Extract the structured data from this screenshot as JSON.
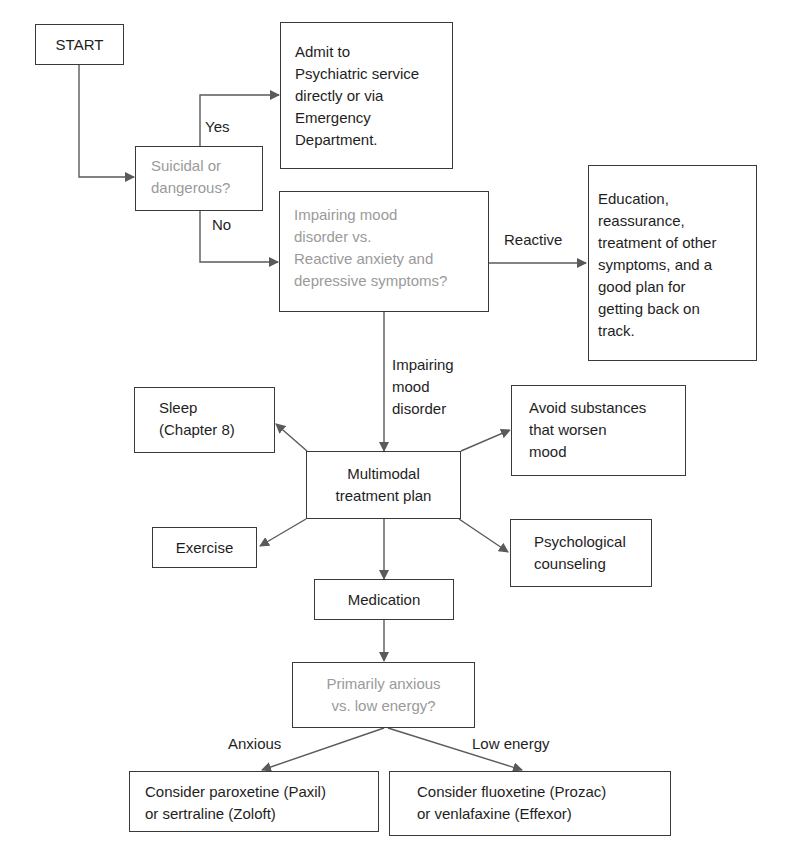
{
  "flowchart": {
    "start": {
      "label": "START"
    },
    "q_suicidal": {
      "lines": [
        "Suicidal or",
        "dangerous?"
      ]
    },
    "admit": {
      "lines": [
        "Admit to",
        "Psychiatric service",
        "directly or via",
        "Emergency",
        "Department."
      ]
    },
    "q_mood": {
      "lines": [
        "Impairing mood",
        "disorder vs.",
        "Reactive anxiety and",
        "depressive symptoms?"
      ]
    },
    "education": {
      "lines": [
        "Education,",
        "reassurance,",
        "treatment of other",
        "symptoms, and a",
        "good plan for",
        "getting back on",
        "track."
      ]
    },
    "sleep": {
      "lines": [
        "Sleep",
        "(Chapter 8)"
      ]
    },
    "avoid": {
      "lines": [
        "Avoid substances",
        "that worsen",
        "mood"
      ]
    },
    "multimodal": {
      "lines": [
        "Multimodal",
        "treatment plan"
      ]
    },
    "exercise": {
      "label": "Exercise"
    },
    "psych": {
      "lines": [
        "Psychological",
        "counseling"
      ]
    },
    "medication": {
      "label": "Medication"
    },
    "q_anxious": {
      "lines": [
        "Primarily anxious",
        "vs. low energy?"
      ]
    },
    "paroxetine": {
      "lines": [
        "Consider paroxetine (Paxil)",
        "or sertraline (Zoloft)"
      ]
    },
    "fluoxetine": {
      "lines": [
        "Consider fluoxetine (Prozac)",
        "or venlafaxine (Effexor)"
      ]
    }
  },
  "edge_labels": {
    "yes": "Yes",
    "no": "No",
    "reactive": "Reactive",
    "impairing": [
      "Impairing",
      "mood",
      "disorder"
    ],
    "anxious": "Anxious",
    "low_energy": "Low energy"
  },
  "colors": {
    "line": "#5a5a5a",
    "box_border": "#3a3a3a",
    "question_text": "#9a9a9a",
    "text": "#1e1e1e"
  }
}
